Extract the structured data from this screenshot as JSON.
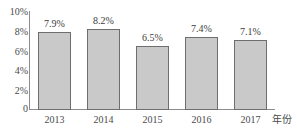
{
  "chart_data": {
    "type": "bar",
    "title": "",
    "subtitle": "",
    "xlabel": "年份",
    "ylabel": "",
    "categories": [
      "2013",
      "2014",
      "2015",
      "2016",
      "2017"
    ],
    "values": [
      7.9,
      8.2,
      6.5,
      7.4,
      7.1
    ],
    "data_labels": [
      "7.9%",
      "8.2%",
      "6.5%",
      "7.4%",
      "7.1%"
    ],
    "ylim": [
      0,
      10
    ],
    "ytick_values": [
      10,
      8,
      6,
      4,
      2,
      0
    ],
    "ytick_labels": [
      "10%",
      "8%",
      "6%",
      "4%",
      "2%",
      "0"
    ],
    "grid": false,
    "legend": null,
    "legend_position": "none",
    "bar_fill_color": "#c9c9c9",
    "bar_border_color": "#6e6e6e",
    "axis_color": "#8c8c8c",
    "text_color": "#4a4a4a",
    "background_color": "#ffffff"
  }
}
